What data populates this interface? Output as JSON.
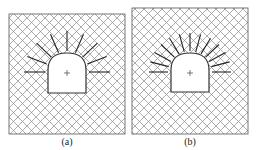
{
  "figure": {
    "panels": [
      {
        "id": "a",
        "caption": "(a)",
        "description": "Tunnel cross-section with arched roof and radial rock bolts (sparse)",
        "bolt_count": 9,
        "centerline_marker": "+"
      },
      {
        "id": "b",
        "caption": "(b)",
        "description": "Tunnel cross-section with arched roof and radial rock bolts (dense)",
        "bolt_count": 13,
        "centerline_marker": "+"
      }
    ],
    "colors": {
      "hatch": "#8a8a8a",
      "outline": "#333333",
      "bolt": "#222222",
      "opening_fill": "#ffffff"
    }
  }
}
